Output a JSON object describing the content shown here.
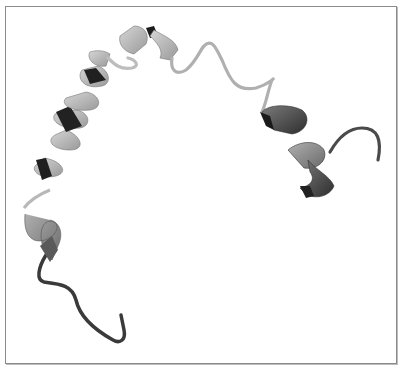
{
  "figure": {
    "elements": [
      {
        "name": "n-terminal-coil",
        "type": "coil",
        "color": "#3a3a3a"
      },
      {
        "name": "helix-1",
        "type": "alpha-helix",
        "color": "#8c8c8c"
      },
      {
        "name": "helix-2",
        "type": "alpha-helix",
        "color": "#a8a8a8"
      },
      {
        "name": "helix-3",
        "type": "alpha-helix",
        "color": "#bdbdbd"
      },
      {
        "name": "middle-loop",
        "type": "coil",
        "color": "#b5b5b5"
      },
      {
        "name": "helix-4",
        "type": "alpha-helix",
        "color": "#555555"
      },
      {
        "name": "c-terminal-coil",
        "type": "coil",
        "color": "#4a4a4a"
      }
    ],
    "colors": {
      "background": "#ffffff",
      "border": "#8a8a8a",
      "dark_shade": "#2a2a2a",
      "light_shade": "#c8c8c8"
    }
  }
}
